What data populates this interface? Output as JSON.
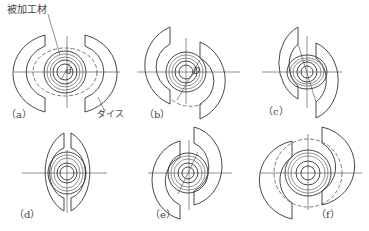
{
  "diagram": {
    "title_label": "被加工材",
    "die_label": "ダイス",
    "dimension_symbols": {
      "inner_diameter": "d",
      "outer_diameter": "D"
    },
    "panels": [
      {
        "id": "a",
        "label": "（a）"
      },
      {
        "id": "b",
        "label": "（b）"
      },
      {
        "id": "c",
        "label": "（c）"
      },
      {
        "id": "d",
        "label": "（d）"
      },
      {
        "id": "e",
        "label": "（e）"
      },
      {
        "id": "f",
        "label": "（f）"
      }
    ],
    "colors": {
      "line": "#333333",
      "background": "#ffffff"
    }
  }
}
